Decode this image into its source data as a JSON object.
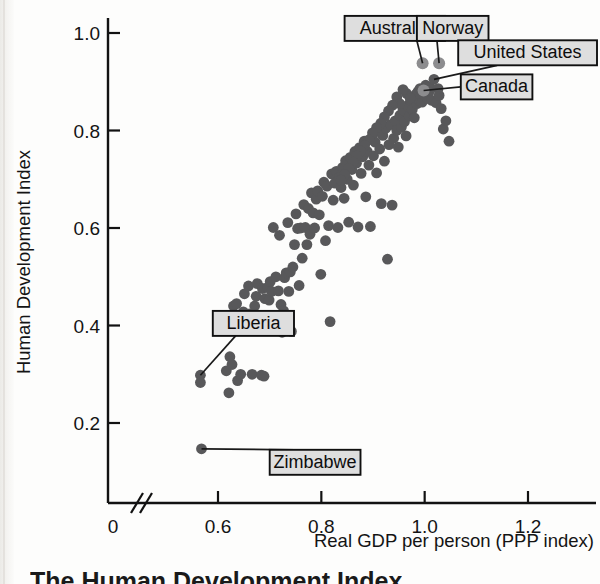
{
  "figure": {
    "caption": "The Human Development Index"
  },
  "chart_data": {
    "type": "scatter",
    "title": "",
    "xlabel": "Real GDP per person (PPP index)",
    "ylabel": "Human Development Index",
    "xlim": [
      0.52,
      1.3
    ],
    "ylim": [
      0.0,
      1.05
    ],
    "grid": false,
    "legend": "none",
    "axis_break_x": true,
    "xticks": [
      0,
      0.6,
      0.8,
      1.0,
      1.2
    ],
    "xtick_labels": [
      "0",
      "0.6",
      "0.8",
      "1.0",
      "1.2"
    ],
    "yticks": [
      0.2,
      0.4,
      0.6,
      0.8,
      1.0
    ],
    "ytick_labels": [
      "0.2",
      "0.4",
      "0.6",
      "0.8",
      "1.0"
    ],
    "marker_color": "#58585a",
    "highlight_color": "#8c8c8e",
    "annotations": [
      {
        "label": "Australia",
        "x": 0.996,
        "y": 0.938,
        "box_x": 0.845,
        "box_y": 1.035
      },
      {
        "label": "Norway",
        "x": 1.028,
        "y": 0.938,
        "box_x": 0.985,
        "box_y": 1.035
      },
      {
        "label": "United States",
        "x": 1.018,
        "y": 0.905,
        "box_x": 1.07,
        "box_y": 0.985
      },
      {
        "label": "Canada",
        "x": 0.998,
        "y": 0.882,
        "box_x": 1.07,
        "box_y": 0.915
      },
      {
        "label": "Liberia",
        "x": 0.566,
        "y": 0.298,
        "box_x": 0.59,
        "box_y": 0.43
      },
      {
        "label": "Zimbabwe",
        "x": 0.568,
        "y": 0.147,
        "box_x": 0.7,
        "box_y": 0.145
      }
    ],
    "points": [
      [
        0.566,
        0.298
      ],
      [
        0.566,
        0.283
      ],
      [
        0.568,
        0.147
      ],
      [
        0.616,
        0.307
      ],
      [
        0.621,
        0.262
      ],
      [
        0.623,
        0.336
      ],
      [
        0.627,
        0.32
      ],
      [
        0.63,
        0.44
      ],
      [
        0.633,
        0.389
      ],
      [
        0.636,
        0.445
      ],
      [
        0.638,
        0.287
      ],
      [
        0.641,
        0.42
      ],
      [
        0.644,
        0.3
      ],
      [
        0.646,
        0.398
      ],
      [
        0.649,
        0.428
      ],
      [
        0.651,
        0.465
      ],
      [
        0.654,
        0.41
      ],
      [
        0.657,
        0.416
      ],
      [
        0.659,
        0.481
      ],
      [
        0.661,
        0.424
      ],
      [
        0.664,
        0.415
      ],
      [
        0.666,
        0.3
      ],
      [
        0.669,
        0.404
      ],
      [
        0.671,
        0.44
      ],
      [
        0.674,
        0.46
      ],
      [
        0.676,
        0.486
      ],
      [
        0.679,
        0.412
      ],
      [
        0.681,
        0.418
      ],
      [
        0.684,
        0.298
      ],
      [
        0.686,
        0.476
      ],
      [
        0.689,
        0.296
      ],
      [
        0.691,
        0.455
      ],
      [
        0.694,
        0.42
      ],
      [
        0.696,
        0.478
      ],
      [
        0.699,
        0.452
      ],
      [
        0.701,
        0.49
      ],
      [
        0.704,
        0.47
      ],
      [
        0.707,
        0.601
      ],
      [
        0.709,
        0.416
      ],
      [
        0.712,
        0.5
      ],
      [
        0.714,
        0.414
      ],
      [
        0.717,
        0.471
      ],
      [
        0.719,
        0.585
      ],
      [
        0.722,
        0.443
      ],
      [
        0.724,
        0.386
      ],
      [
        0.727,
        0.43
      ],
      [
        0.729,
        0.498
      ],
      [
        0.732,
        0.508
      ],
      [
        0.735,
        0.611
      ],
      [
        0.737,
        0.47
      ],
      [
        0.74,
        0.51
      ],
      [
        0.742,
        0.388
      ],
      [
        0.745,
        0.52
      ],
      [
        0.748,
        0.566
      ],
      [
        0.751,
        0.629
      ],
      [
        0.754,
        0.599
      ],
      [
        0.757,
        0.482
      ],
      [
        0.76,
        0.6
      ],
      [
        0.763,
        0.538
      ],
      [
        0.766,
        0.648
      ],
      [
        0.769,
        0.601
      ],
      [
        0.772,
        0.566
      ],
      [
        0.775,
        0.64
      ],
      [
        0.778,
        0.587
      ],
      [
        0.781,
        0.672
      ],
      [
        0.784,
        0.631
      ],
      [
        0.787,
        0.6
      ],
      [
        0.79,
        0.659
      ],
      [
        0.793,
        0.676
      ],
      [
        0.796,
        0.627
      ],
      [
        0.799,
        0.505
      ],
      [
        0.802,
        0.665
      ],
      [
        0.805,
        0.694
      ],
      [
        0.808,
        0.574
      ],
      [
        0.811,
        0.686
      ],
      [
        0.814,
        0.605
      ],
      [
        0.817,
        0.408
      ],
      [
        0.82,
        0.711
      ],
      [
        0.823,
        0.657
      ],
      [
        0.826,
        0.692
      ],
      [
        0.829,
        0.716
      ],
      [
        0.832,
        0.601
      ],
      [
        0.835,
        0.704
      ],
      [
        0.838,
        0.683
      ],
      [
        0.841,
        0.724
      ],
      [
        0.844,
        0.661
      ],
      [
        0.847,
        0.738
      ],
      [
        0.85,
        0.7
      ],
      [
        0.853,
        0.612
      ],
      [
        0.856,
        0.745
      ],
      [
        0.859,
        0.72
      ],
      [
        0.862,
        0.688
      ],
      [
        0.865,
        0.757
      ],
      [
        0.868,
        0.733
      ],
      [
        0.871,
        0.602
      ],
      [
        0.874,
        0.765
      ],
      [
        0.877,
        0.712
      ],
      [
        0.88,
        0.746
      ],
      [
        0.883,
        0.778
      ],
      [
        0.886,
        0.664
      ],
      [
        0.889,
        0.757
      ],
      [
        0.892,
        0.729
      ],
      [
        0.895,
        0.603
      ],
      [
        0.898,
        0.786
      ],
      [
        0.901,
        0.748
      ],
      [
        0.904,
        0.776
      ],
      [
        0.907,
        0.713
      ],
      [
        0.91,
        0.798
      ],
      [
        0.913,
        0.762
      ],
      [
        0.916,
        0.65
      ],
      [
        0.919,
        0.79
      ],
      [
        0.922,
        0.737
      ],
      [
        0.925,
        0.805
      ],
      [
        0.928,
        0.536
      ],
      [
        0.931,
        0.771
      ],
      [
        0.934,
        0.812
      ],
      [
        0.937,
        0.647
      ],
      [
        0.94,
        0.784
      ],
      [
        0.943,
        0.82
      ],
      [
        0.946,
        0.8
      ],
      [
        0.949,
        0.766
      ],
      [
        0.952,
        0.831
      ],
      [
        0.955,
        0.807
      ],
      [
        0.958,
        0.842
      ],
      [
        0.961,
        0.818
      ],
      [
        0.964,
        0.789
      ],
      [
        0.967,
        0.851
      ],
      [
        0.97,
        0.83
      ],
      [
        0.973,
        0.861
      ],
      [
        0.976,
        0.843
      ],
      [
        0.978,
        0.868
      ],
      [
        0.98,
        0.826
      ],
      [
        0.983,
        0.874
      ],
      [
        0.985,
        0.855
      ],
      [
        0.987,
        0.88
      ],
      [
        0.989,
        0.862
      ],
      [
        0.991,
        0.886
      ],
      [
        0.993,
        0.871
      ],
      [
        0.995,
        0.858
      ],
      [
        0.998,
        0.882
      ],
      [
        1.0,
        0.872
      ],
      [
        1.002,
        0.893
      ],
      [
        1.005,
        0.866
      ],
      [
        1.008,
        0.878
      ],
      [
        1.01,
        0.889
      ],
      [
        1.013,
        0.862
      ],
      [
        1.018,
        0.905
      ],
      [
        1.022,
        0.857
      ],
      [
        1.028,
        0.872
      ],
      [
        1.032,
        0.845
      ],
      [
        1.036,
        0.803
      ],
      [
        1.041,
        0.82
      ],
      [
        1.047,
        0.778
      ],
      [
        1.026,
        0.886
      ],
      [
        0.996,
        0.938
      ],
      [
        1.028,
        0.938
      ],
      [
        0.965,
        0.876
      ],
      [
        0.958,
        0.884
      ],
      [
        0.972,
        0.866
      ],
      [
        0.946,
        0.869
      ],
      [
        0.952,
        0.855
      ],
      [
        0.938,
        0.852
      ],
      [
        0.93,
        0.84
      ],
      [
        0.922,
        0.828
      ],
      [
        0.915,
        0.815
      ],
      [
        0.907,
        0.806
      ],
      [
        0.899,
        0.795
      ],
      [
        0.892,
        0.781
      ],
      [
        0.884,
        0.77
      ],
      [
        0.876,
        0.758
      ],
      [
        0.868,
        0.748
      ],
      [
        0.861,
        0.735
      ],
      [
        0.853,
        0.722
      ],
      [
        0.845,
        0.71
      ],
      [
        0.838,
        0.698
      ]
    ],
    "highlighted_points": [
      {
        "label": "Australia",
        "x": 0.996,
        "y": 0.938
      },
      {
        "label": "Norway",
        "x": 1.028,
        "y": 0.938
      },
      {
        "label": "Canada",
        "x": 0.998,
        "y": 0.882
      }
    ]
  }
}
